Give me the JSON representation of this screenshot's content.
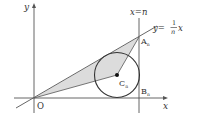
{
  "figure": {
    "colors": {
      "stroke": "#333333",
      "axis": "#555555",
      "shade": "#dcdcdc",
      "background": "#ffffff"
    },
    "axes": {
      "x_label": "x",
      "y_label": "y",
      "origin_label": "O"
    },
    "lines": {
      "vertical_line_label": "x=n",
      "slanted_line_label_lhs": "y=",
      "slanted_line_label_num": "1",
      "slanted_line_label_den": "n",
      "slanted_line_label_var": "x"
    },
    "points": {
      "A": {
        "label": "A",
        "subscript": "n"
      },
      "B": {
        "label": "B",
        "subscript": "n"
      },
      "C": {
        "label": "C",
        "subscript": "n"
      }
    }
  }
}
